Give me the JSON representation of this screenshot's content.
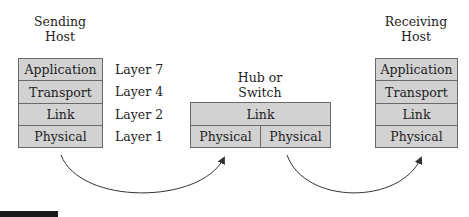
{
  "sending_host": {
    "title_line1": "Sending",
    "title_line2": "Host",
    "layers": [
      {
        "name": "Application",
        "label": "Layer 7"
      },
      {
        "name": "Transport",
        "label": "Layer 4"
      },
      {
        "name": "Link",
        "label": "Layer 2"
      },
      {
        "name": "Physical",
        "label": "Layer 1"
      }
    ]
  },
  "hub": {
    "title_line1": "Hub or",
    "title_line2": "Switch",
    "top_layer": "Link",
    "bottom_layers": [
      "Physical",
      "Physical"
    ]
  },
  "receiving_host": {
    "title_line1": "Receiving",
    "title_line2": "Host",
    "layers": [
      {
        "name": "Application"
      },
      {
        "name": "Transport"
      },
      {
        "name": "Link"
      },
      {
        "name": "Physical"
      }
    ]
  },
  "colors": {
    "box_fill": "#d2d2d2",
    "box_border": "#6a6a6a",
    "arrow": "#333333"
  }
}
